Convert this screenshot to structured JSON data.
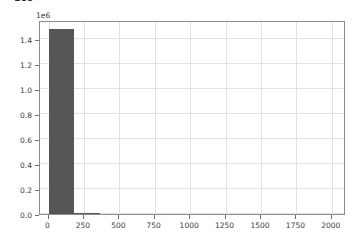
{
  "figure": {
    "title_fragment": "1e6",
    "offset_label": "1e6",
    "background_color": "#ffffff",
    "bar_color": "#565656",
    "grid_color": "#e2e2e2",
    "spine_color": "#8d8d8d"
  },
  "chart_data": {
    "type": "bar",
    "title": "",
    "xlabel": "",
    "ylabel": "",
    "xlim": [
      -60,
      2100
    ],
    "ylim": [
      0,
      1.55
    ],
    "y_multiplier": "1e6",
    "grid": true,
    "legend": null,
    "x_ticks": [
      0,
      250,
      500,
      750,
      1000,
      1250,
      1500,
      1750,
      2000
    ],
    "x_tick_labels": [
      "0",
      "250",
      "500",
      "750",
      "1000",
      "1250",
      "1500",
      "1750",
      "2000"
    ],
    "y_ticks": [
      0.0,
      0.2,
      0.4,
      0.6,
      0.8,
      1.0,
      1.2,
      1.4
    ],
    "y_tick_labels": [
      "0.0",
      "0.2",
      "0.4",
      "0.6",
      "0.8",
      "1.0",
      "1.2",
      "1.4"
    ],
    "bins": [
      {
        "x_start": 0,
        "x_end": 180,
        "value": 1.48
      },
      {
        "x_start": 180,
        "x_end": 360,
        "value": 0.012
      }
    ]
  }
}
